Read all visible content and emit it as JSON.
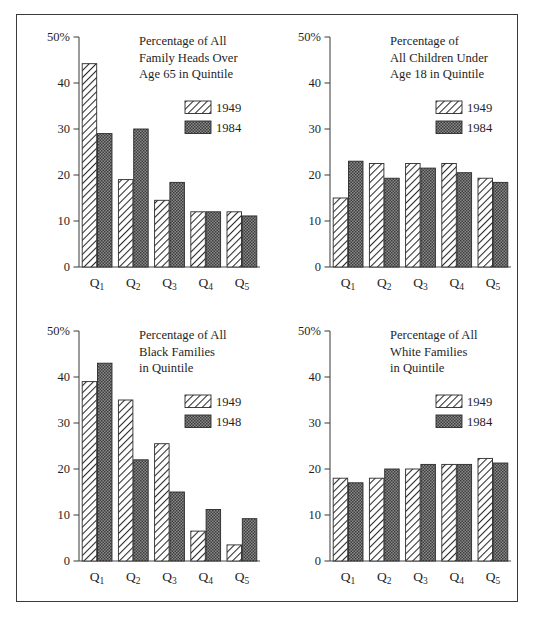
{
  "figure": {
    "border_color": "#3a3a3a",
    "background": "#ffffff",
    "series_colors": {
      "hatch_series": "#ffffff",
      "hatch_stroke": "#2b2b2b",
      "solid_series": "#6e6e6e"
    }
  },
  "axis": {
    "y_ticks": [
      "50%",
      "40",
      "30",
      "20",
      "10",
      "0"
    ],
    "y_values": [
      50,
      40,
      30,
      20,
      10,
      0
    ],
    "categories": [
      "Q1",
      "Q2",
      "Q3",
      "Q4",
      "Q5"
    ],
    "category_bases": [
      "Q",
      "Q",
      "Q",
      "Q",
      "Q"
    ],
    "category_subscripts": [
      "1",
      "2",
      "3",
      "4",
      "5"
    ]
  },
  "chart_data": [
    {
      "type": "bar",
      "panel": "top-left",
      "title": "Percentage of All Family Heads Over Age 65 in Quintile",
      "title_lines": [
        "Percentage of All",
        "Family Heads Over",
        "Age 65 in Quintile"
      ],
      "categories": [
        "Q1",
        "Q2",
        "Q3",
        "Q4",
        "Q5"
      ],
      "series": [
        {
          "name": "1949",
          "values": [
            44.2,
            19.0,
            14.5,
            12.0,
            12.0
          ],
          "fill": "hatch"
        },
        {
          "name": "1984",
          "values": [
            29.0,
            30.0,
            18.4,
            12.0,
            11.1
          ],
          "fill": "solid"
        }
      ],
      "xlabel": "",
      "ylabel": "",
      "ylim": [
        0,
        50
      ],
      "grid": false,
      "legend_position": "top-right"
    },
    {
      "type": "bar",
      "panel": "top-right",
      "title": "Percentage of All Children Under Age 18 in Quintile",
      "title_lines": [
        "Percentage of",
        "All Children Under",
        "Age 18 in Quintile"
      ],
      "categories": [
        "Q1",
        "Q2",
        "Q3",
        "Q4",
        "Q5"
      ],
      "series": [
        {
          "name": "1949",
          "values": [
            15.0,
            22.5,
            22.5,
            22.5,
            19.3
          ],
          "fill": "hatch"
        },
        {
          "name": "1984",
          "values": [
            23.0,
            19.3,
            21.5,
            20.5,
            18.4
          ],
          "fill": "solid"
        }
      ],
      "xlabel": "",
      "ylabel": "",
      "ylim": [
        0,
        50
      ],
      "grid": false,
      "legend_position": "top-right"
    },
    {
      "type": "bar",
      "panel": "bottom-left",
      "title": "Percentage of All Black Families in Quintile",
      "title_lines": [
        "Percentage of All",
        "Black Families",
        "in Quintile"
      ],
      "categories": [
        "Q1",
        "Q2",
        "Q3",
        "Q4",
        "Q5"
      ],
      "series": [
        {
          "name": "1949",
          "values": [
            39.0,
            35.0,
            25.5,
            6.5,
            3.5
          ],
          "fill": "hatch"
        },
        {
          "name": "1948",
          "values": [
            43.0,
            22.0,
            15.0,
            11.2,
            9.2
          ],
          "fill": "solid"
        }
      ],
      "xlabel": "",
      "ylabel": "",
      "ylim": [
        0,
        50
      ],
      "grid": false,
      "legend_position": "top-right"
    },
    {
      "type": "bar",
      "panel": "bottom-right",
      "title": "Percentage of All White Families in Quintile",
      "title_lines": [
        "Percentage of All",
        "White Families",
        "in Quintile"
      ],
      "categories": [
        "Q1",
        "Q2",
        "Q3",
        "Q4",
        "Q5"
      ],
      "series": [
        {
          "name": "1949",
          "values": [
            18.0,
            18.0,
            20.0,
            21.0,
            22.3
          ],
          "fill": "hatch"
        },
        {
          "name": "1984",
          "values": [
            17.0,
            20.0,
            21.0,
            21.0,
            21.3
          ],
          "fill": "solid"
        }
      ],
      "xlabel": "",
      "ylabel": "",
      "ylim": [
        0,
        50
      ],
      "grid": false,
      "legend_position": "top-right"
    }
  ]
}
